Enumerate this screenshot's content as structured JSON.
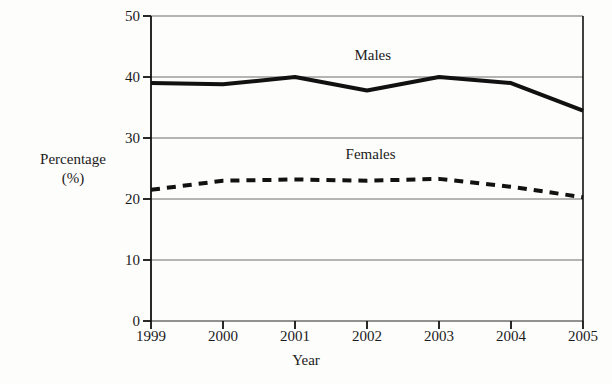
{
  "chart_data": {
    "type": "line",
    "title": "",
    "subtitle": "",
    "xlabel": "Year",
    "ylabel_line1": "Percentage",
    "ylabel_line2": "(%)",
    "categories": [
      "1999",
      "2000",
      "2001",
      "2002",
      "2003",
      "2004",
      "2005"
    ],
    "x": [
      1999,
      2000,
      2001,
      2002,
      2003,
      2004,
      2005
    ],
    "xlim": [
      1999,
      2005
    ],
    "ylim": [
      0,
      50
    ],
    "yticks": [
      "0",
      "10",
      "20",
      "30",
      "40",
      "50"
    ],
    "ytick_values": [
      0,
      10,
      20,
      30,
      40,
      50
    ],
    "grid": "horizontal",
    "legend": "inline-annotations",
    "series": [
      {
        "name": "Males",
        "style": "solid",
        "color": "#111111",
        "width": 4,
        "values": [
          39.0,
          38.8,
          40.0,
          37.8,
          40.0,
          39.0,
          34.5
        ],
        "annotation": {
          "text": "Males",
          "x": 2002.08,
          "y": 43.6
        }
      },
      {
        "name": "Females",
        "style": "dashed",
        "color": "#111111",
        "width": 4,
        "values": [
          21.5,
          23.0,
          23.2,
          23.0,
          23.3,
          22.0,
          20.3
        ],
        "annotation": {
          "text": "Females",
          "x": 2002.05,
          "y": 27.3
        }
      }
    ],
    "colors": {
      "background": "#fdfdfb",
      "axis": "#111111",
      "grid": "#6d6d6d",
      "text": "#1b1b1b"
    }
  }
}
